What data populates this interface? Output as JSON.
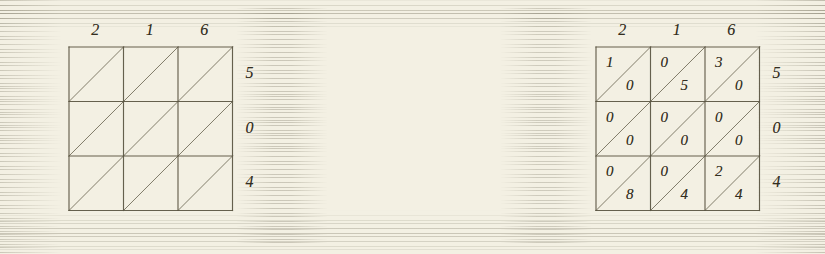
{
  "figure": {
    "paper_color": "#f3f0e3",
    "ink_color": "#332e21",
    "rule_color": "#5d5744"
  },
  "chart_data": {
    "type": "table",
    "xlabel": "",
    "ylabel": "",
    "grid": true,
    "legend_position": "none",
    "panels": [
      {
        "name": "stage-1-empty-lattice",
        "columns": 3,
        "rows": 3,
        "top_labels": [
          "2",
          "1",
          "6"
        ],
        "right_labels": [
          "5",
          "0",
          "4"
        ],
        "left_labels": [],
        "bottom_labels": [],
        "cells": [
          [
            {
              "upper": "",
              "lower": ""
            },
            {
              "upper": "",
              "lower": ""
            },
            {
              "upper": "",
              "lower": ""
            }
          ],
          [
            {
              "upper": "",
              "lower": ""
            },
            {
              "upper": "",
              "lower": ""
            },
            {
              "upper": "",
              "lower": ""
            }
          ],
          [
            {
              "upper": "",
              "lower": ""
            },
            {
              "upper": "",
              "lower": ""
            },
            {
              "upper": "",
              "lower": ""
            }
          ]
        ]
      },
      {
        "name": "stage-2-products-filled",
        "columns": 3,
        "rows": 3,
        "top_labels": [
          "2",
          "1",
          "6"
        ],
        "right_labels": [
          "5",
          "0",
          "4"
        ],
        "left_labels": [],
        "bottom_labels": [],
        "cells": [
          [
            {
              "upper": "1",
              "lower": "0"
            },
            {
              "upper": "0",
              "lower": "5"
            },
            {
              "upper": "3",
              "lower": "0"
            }
          ],
          [
            {
              "upper": "0",
              "lower": "0"
            },
            {
              "upper": "0",
              "lower": "0"
            },
            {
              "upper": "0",
              "lower": "0"
            }
          ],
          [
            {
              "upper": "0",
              "lower": "8"
            },
            {
              "upper": "0",
              "lower": "4"
            },
            {
              "upper": "2",
              "lower": "4"
            }
          ]
        ]
      },
      {
        "name": "stage-3-diagonals-summed",
        "columns": 3,
        "rows": 3,
        "top_labels": [
          "2",
          "1",
          "6"
        ],
        "right_labels": [
          "5",
          "0",
          "4"
        ],
        "left_labels": [
          "1",
          "0",
          "8"
        ],
        "bottom_labels": [
          "8",
          "6",
          "4"
        ],
        "cells": [
          [
            {
              "upper": "1",
              "lower": "0"
            },
            {
              "upper": "0",
              "lower": "5"
            },
            {
              "upper": "3",
              "lower": "0"
            }
          ],
          [
            {
              "upper": "0",
              "lower": "0"
            },
            {
              "upper": "0",
              "lower": "0"
            },
            {
              "upper": "0",
              "lower": "0"
            }
          ],
          [
            {
              "upper": "0",
              "lower": "8"
            },
            {
              "upper": "0",
              "lower": "4"
            },
            {
              "upper": "2",
              "lower": "4"
            }
          ]
        ]
      }
    ]
  }
}
